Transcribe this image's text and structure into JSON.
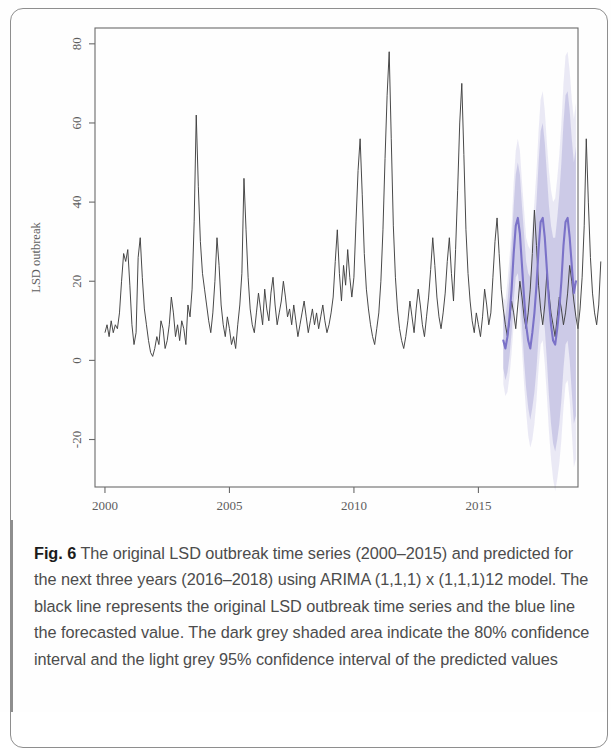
{
  "figure": {
    "label": "Fig. 6",
    "caption": "The original LSD outbreak time series (2000–2015) and predicted for the next three years (2016–2018) using ARIMA (1,1,1) x (1,1,1)12 model. The black line represents the original LSD outbreak time series and the blue line the forecasted value. The dark grey shaded area indicate the 80% confidence interval and the light grey 95% confidence interval of the predicted values"
  },
  "chart_data": {
    "type": "line",
    "title": "",
    "xlabel": "Time",
    "ylabel": "LSD outbreak",
    "xlim": [
      1999.6,
      2019.0
    ],
    "ylim": [
      -32,
      84
    ],
    "xticks": [
      2000,
      2005,
      2010,
      2015
    ],
    "yticks": [
      -20,
      0,
      20,
      40,
      60,
      80
    ],
    "grid": false,
    "legend_position": "none",
    "colors": {
      "observed_line": "#3f3f3f",
      "forecast_line": "#7b72c8",
      "ci80_band": "#c9c6e6",
      "ci95_band": "#e6e5f3",
      "axis": "#6a6a6a",
      "text": "#5d5d5d"
    },
    "series": [
      {
        "name": "Original LSD outbreak time series",
        "type": "observed",
        "color": "#3f3f3f",
        "x_start": 2000.0,
        "x_step": 0.08333,
        "values": [
          7,
          9,
          6,
          10,
          7,
          9,
          8,
          12,
          20,
          27,
          25,
          28,
          19,
          9,
          4,
          7,
          26,
          31,
          21,
          13,
          9,
          5,
          2,
          1,
          3,
          6,
          4,
          10,
          8,
          3,
          5,
          9,
          16,
          12,
          6,
          9,
          5,
          10,
          8,
          4,
          14,
          11,
          18,
          35,
          62,
          44,
          30,
          22,
          18,
          14,
          10,
          7,
          12,
          20,
          31,
          24,
          14,
          9,
          6,
          11,
          8,
          4,
          6,
          3,
          9,
          14,
          22,
          46,
          33,
          21,
          13,
          9,
          7,
          12,
          17,
          13,
          9,
          18,
          13,
          10,
          17,
          21,
          14,
          9,
          12,
          15,
          20,
          16,
          11,
          13,
          9,
          14,
          10,
          6,
          9,
          12,
          15,
          11,
          7,
          10,
          13,
          9,
          12,
          8,
          11,
          14,
          10,
          7,
          9,
          12,
          16,
          25,
          33,
          22,
          15,
          24,
          19,
          28,
          21,
          16,
          21,
          35,
          48,
          56,
          42,
          27,
          18,
          13,
          9,
          6,
          4,
          8,
          12,
          20,
          33,
          51,
          67,
          78,
          56,
          34,
          21,
          13,
          8,
          5,
          3,
          6,
          10,
          15,
          11,
          7,
          13,
          18,
          14,
          9,
          6,
          11,
          16,
          23,
          31,
          24,
          16,
          11,
          8,
          12,
          17,
          25,
          31,
          22,
          15,
          28,
          43,
          60,
          70,
          52,
          33,
          22,
          15,
          10,
          7,
          12,
          9,
          6,
          11,
          18,
          14,
          9,
          12,
          21,
          30,
          36,
          27,
          18,
          13,
          9,
          6,
          10,
          15,
          12,
          8,
          14,
          20,
          16,
          11,
          8,
          12,
          18,
          27,
          38,
          29,
          19,
          13,
          9,
          14,
          22,
          17,
          12,
          9,
          6,
          11,
          16,
          13,
          9,
          12,
          17,
          24,
          20,
          15,
          11,
          8,
          13,
          21,
          34,
          56,
          40,
          26,
          17,
          12,
          9,
          14,
          25
        ]
      },
      {
        "name": "Forecasted value",
        "type": "forecast",
        "color": "#7b72c8",
        "x_start": 2016.0,
        "x_step": 0.08333,
        "values": [
          5,
          3,
          6,
          11,
          18,
          27,
          34,
          36,
          32,
          24,
          16,
          9,
          5,
          3,
          7,
          12,
          19,
          28,
          35,
          36,
          31,
          23,
          15,
          9,
          5,
          4,
          8,
          13,
          20,
          29,
          35,
          36,
          31,
          24,
          17,
          20
        ],
        "ci80_lower": [
          -2,
          -5,
          -3,
          1,
          7,
          15,
          21,
          22,
          17,
          9,
          0,
          -7,
          -12,
          -15,
          -12,
          -8,
          -2,
          6,
          12,
          13,
          8,
          0,
          -9,
          -16,
          -21,
          -23,
          -20,
          -16,
          -10,
          -2,
          4,
          5,
          0,
          -8,
          -16,
          -14
        ],
        "ci80_upper": [
          12,
          11,
          15,
          21,
          29,
          39,
          47,
          50,
          47,
          39,
          32,
          25,
          22,
          21,
          26,
          32,
          40,
          50,
          58,
          60,
          55,
          47,
          39,
          34,
          31,
          31,
          36,
          42,
          50,
          60,
          67,
          68,
          63,
          56,
          50,
          54
        ],
        "ci95_lower": [
          -6,
          -9,
          -8,
          -4,
          2,
          9,
          15,
          16,
          11,
          3,
          -6,
          -13,
          -19,
          -22,
          -20,
          -16,
          -10,
          -2,
          4,
          5,
          -1,
          -9,
          -18,
          -25,
          -30,
          -33,
          -30,
          -26,
          -20,
          -12,
          -6,
          -5,
          -10,
          -18,
          -27,
          -25
        ],
        "ci95_upper": [
          16,
          15,
          20,
          26,
          34,
          45,
          53,
          56,
          53,
          45,
          38,
          31,
          29,
          28,
          34,
          40,
          48,
          58,
          66,
          68,
          63,
          55,
          48,
          43,
          40,
          41,
          46,
          52,
          60,
          70,
          77,
          78,
          73,
          66,
          61,
          65
        ]
      }
    ]
  }
}
